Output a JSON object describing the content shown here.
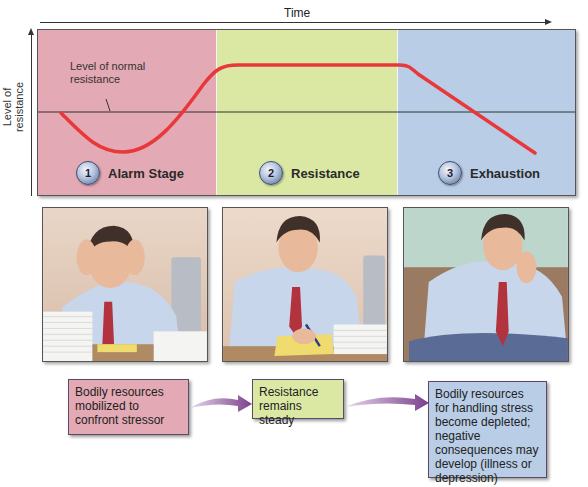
{
  "axes": {
    "x_label": "Time",
    "y_label": "Level of resistance"
  },
  "chart": {
    "normal_line_label": "Level of normal resistance",
    "curve_color": "#e8383a",
    "stages": [
      {
        "number": "1",
        "label": "Alarm Stage",
        "color": "#e3a9b4"
      },
      {
        "number": "2",
        "label": "Resistance",
        "color": "#dbe8a4"
      },
      {
        "number": "3",
        "label": "Exhaustion",
        "color": "#b9cde6"
      }
    ]
  },
  "illustrations": [
    {
      "caption": "Man at desk holding head in hands, surrounded by paper stacks"
    },
    {
      "caption": "Man at desk writing on yellow notepad"
    },
    {
      "caption": "Man slumped on couch resting head on hand"
    }
  ],
  "descriptions": [
    {
      "text": "Bodily resources mobilized to confront stressor",
      "color": "#e3a9b4"
    },
    {
      "text": "Resistance remains steady",
      "color": "#dbe8a4"
    },
    {
      "text": "Bodily resources for handling stress become depleted; negative consequences may develop (illness or depression)",
      "color": "#b9cde6"
    }
  ],
  "arrow_color": "#7b3f8c"
}
